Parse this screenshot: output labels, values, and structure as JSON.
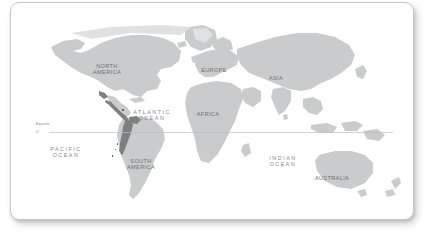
{
  "card": {
    "name": "world-map-card",
    "background_color": "#ffffff",
    "border_color": "#c6c7c8",
    "corner_radius_px": 9
  },
  "map": {
    "land_color": "#c9cbcc",
    "land_color_light": "#d6d8d9",
    "highlight_color": "#7d8082",
    "ocean_color": "#ffffff",
    "projection_note": "world mercator-style outline"
  },
  "graticule": {
    "equator_label": "Equator",
    "equator_degree_label": "0°",
    "line_color": "#bcbec0"
  },
  "continent_labels": [
    {
      "id": "north-america",
      "text": "NORTH\nAMERICA",
      "x": 86,
      "y": 60
    },
    {
      "id": "europe",
      "text": "EUROPE",
      "x": 196,
      "y": 64
    },
    {
      "id": "asia",
      "text": "ASIA",
      "x": 261,
      "y": 72
    },
    {
      "id": "africa",
      "text": "AFRICA",
      "x": 190,
      "y": 108
    },
    {
      "id": "south-america",
      "text": "SOUTH\nAMERICA",
      "x": 121,
      "y": 155
    },
    {
      "id": "australia",
      "text": "AUSTRALIA",
      "x": 313,
      "y": 172
    }
  ],
  "ocean_labels": [
    {
      "id": "atlantic-ocean",
      "text": "ATLANTIC\nOCEAN",
      "x": 127,
      "y": 106
    },
    {
      "id": "pacific-ocean",
      "text": "PACIFIC\nOCEAN",
      "x": 41,
      "y": 143
    },
    {
      "id": "indian-ocean",
      "text": "INDIAN\nOCEAN",
      "x": 258,
      "y": 152
    }
  ],
  "markers": [
    {
      "id": "atlantic-marker",
      "x": 122.0,
      "y": 109.0,
      "size": 2.6
    },
    {
      "id": "south-america-marker-1",
      "x": 116.5,
      "y": 143.0,
      "size": 1.9
    },
    {
      "id": "south-america-marker-2",
      "x": 121.0,
      "y": 152.5,
      "size": 1.7
    },
    {
      "id": "south-america-marker-3",
      "x": 111.5,
      "y": 155.0,
      "size": 1.5
    },
    {
      "id": "south-america-marker-4",
      "x": 114.5,
      "y": 148.5,
      "size": 1.4
    }
  ]
}
